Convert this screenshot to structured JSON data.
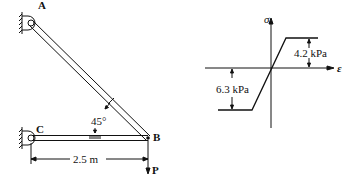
{
  "structure": {
    "points": {
      "A": "A",
      "B": "B",
      "C": "C"
    },
    "angle_label": "45°",
    "length_label": "2.5 m",
    "load_label": "P"
  },
  "stress_strain": {
    "y_axis_label": "σ",
    "x_axis_label": "ε",
    "tension_yield_label": "4.2 kPa",
    "compression_yield_label": "6.3 kPa"
  },
  "colors": {
    "ink": "#111111",
    "background": "#ffffff"
  }
}
